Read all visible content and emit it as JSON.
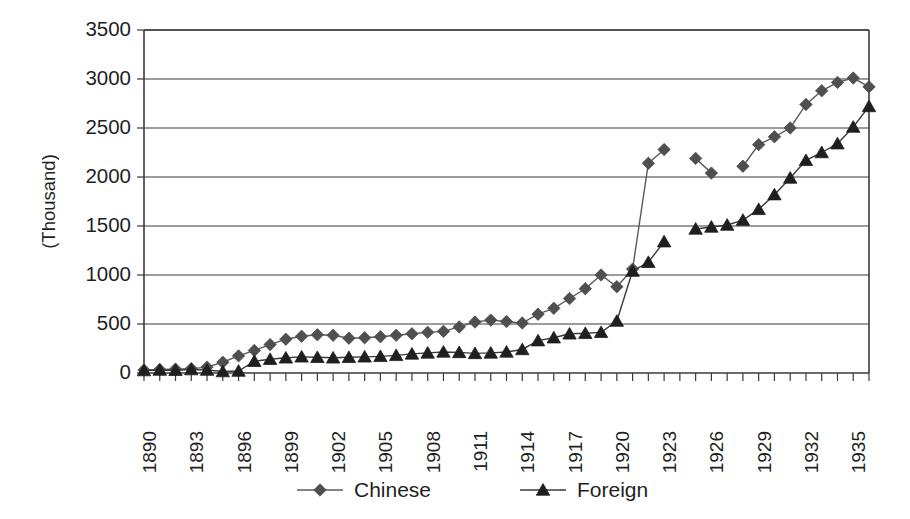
{
  "chart_data": {
    "type": "line",
    "title": "",
    "subtitle": "",
    "xlabel": "",
    "ylabel": "(Thousand)",
    "ylim": [
      0,
      3500
    ],
    "ytick_step": 500,
    "ytick_labels": [
      "0",
      "500",
      "1000",
      "1500",
      "2000",
      "2500",
      "3000",
      "3500"
    ],
    "ytick_values": [
      0,
      500,
      1000,
      1500,
      2000,
      2500,
      3000,
      3500
    ],
    "grid": "horizontal",
    "legend_position": "bottom",
    "xlim": [
      1890,
      1936
    ],
    "x": [
      1890,
      1891,
      1892,
      1893,
      1894,
      1895,
      1896,
      1897,
      1898,
      1899,
      1900,
      1901,
      1902,
      1903,
      1904,
      1905,
      1906,
      1907,
      1908,
      1909,
      1910,
      1911,
      1912,
      1913,
      1914,
      1915,
      1916,
      1917,
      1918,
      1919,
      1920,
      1921,
      1922,
      1923,
      1924,
      1925,
      1926,
      1927,
      1928,
      1929,
      1930,
      1931,
      1932,
      1933,
      1934,
      1935,
      1936
    ],
    "xtick_labels": [
      "1890",
      "1893",
      "1896",
      "1899",
      "1902",
      "1905",
      "1908",
      "1911",
      "1914",
      "1917",
      "1920",
      "1923",
      "1926",
      "1929",
      "1932",
      "1935"
    ],
    "xtick_label_years": [
      1890,
      1893,
      1896,
      1899,
      1902,
      1905,
      1908,
      1911,
      1914,
      1917,
      1920,
      1923,
      1926,
      1929,
      1932,
      1935
    ],
    "series": [
      {
        "name": "Chinese",
        "marker": "diamond",
        "color": "#4f4f4f",
        "line_color": "#5a5a5a",
        "values": [
          30,
          35,
          40,
          45,
          60,
          110,
          175,
          230,
          290,
          345,
          375,
          390,
          385,
          355,
          360,
          370,
          385,
          400,
          415,
          425,
          470,
          520,
          540,
          525,
          510,
          600,
          660,
          760,
          860,
          1000,
          880,
          1060,
          2140,
          2280,
          null,
          2190,
          2040,
          null,
          2110,
          2330,
          2410,
          2500,
          2740,
          2880,
          2965,
          3010,
          2920
        ]
      },
      {
        "name": "Foreign",
        "marker": "triangle",
        "color": "#1f1f1f",
        "line_color": "#3a3a3a",
        "values": [
          25,
          30,
          28,
          35,
          30,
          15,
          20,
          120,
          140,
          155,
          165,
          160,
          155,
          160,
          165,
          170,
          180,
          195,
          205,
          215,
          210,
          200,
          205,
          215,
          240,
          330,
          360,
          400,
          405,
          415,
          530,
          1040,
          1130,
          1340,
          null,
          1470,
          1490,
          1510,
          1560,
          1670,
          1820,
          1990,
          2170,
          2250,
          2340,
          2510,
          2720
        ]
      }
    ]
  },
  "legend": {
    "entries": [
      {
        "label": "Chinese"
      },
      {
        "label": "Foreign"
      }
    ]
  },
  "axes": {
    "y_title": "(Thousand)"
  }
}
